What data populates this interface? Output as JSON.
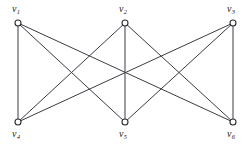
{
  "figure": {
    "width": 251,
    "height": 145,
    "background_color": "#ffffff",
    "edge_color": "#3b3b44",
    "node_stroke_color": "#2c2c33",
    "node_fill_color": "#ffffff",
    "label_color": "#1b1b20"
  },
  "chart_data": {
    "type": "diagram",
    "subtype": "graph",
    "title": "",
    "grid": false,
    "legend": null,
    "node_radius": 3,
    "nodes": [
      {
        "id": "v1",
        "label_main": "v",
        "label_sub": "1",
        "x": 18,
        "y": 23,
        "label_x": 12,
        "label_y": 4,
        "label_position": "above"
      },
      {
        "id": "v2",
        "label_main": "v",
        "label_sub": "2",
        "x": 125,
        "y": 23,
        "label_x": 119,
        "label_y": 4,
        "label_position": "above"
      },
      {
        "id": "v3",
        "label_main": "v",
        "label_sub": "3",
        "x": 233,
        "y": 23,
        "label_x": 227,
        "label_y": 4,
        "label_position": "above"
      },
      {
        "id": "v4",
        "label_main": "v",
        "label_sub": "4",
        "x": 18,
        "y": 122,
        "label_x": 12,
        "label_y": 129,
        "label_position": "below"
      },
      {
        "id": "v5",
        "label_main": "v",
        "label_sub": "5",
        "x": 125,
        "y": 122,
        "label_x": 119,
        "label_y": 129,
        "label_position": "below"
      },
      {
        "id": "v6",
        "label_main": "v",
        "label_sub": "6",
        "x": 233,
        "y": 122,
        "label_x": 227,
        "label_y": 129,
        "label_position": "below"
      }
    ],
    "edges": [
      {
        "id": "e1",
        "source": "v1",
        "target": "v4"
      },
      {
        "id": "e2",
        "source": "v1",
        "target": "v5"
      },
      {
        "id": "e3",
        "source": "v1",
        "target": "v6"
      },
      {
        "id": "e4",
        "source": "v2",
        "target": "v4"
      },
      {
        "id": "e5",
        "source": "v2",
        "target": "v5"
      },
      {
        "id": "e6",
        "source": "v2",
        "target": "v6"
      },
      {
        "id": "e7",
        "source": "v3",
        "target": "v4"
      },
      {
        "id": "e8",
        "source": "v3",
        "target": "v5"
      },
      {
        "id": "e9",
        "source": "v3",
        "target": "v6"
      }
    ],
    "partition_top": [
      "v1",
      "v2",
      "v3"
    ],
    "partition_bottom": [
      "v4",
      "v5",
      "v6"
    ],
    "node_count": 6,
    "edge_count": 9
  }
}
